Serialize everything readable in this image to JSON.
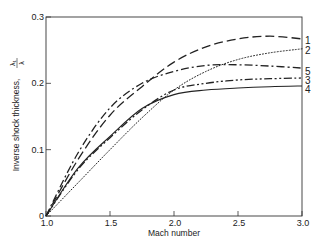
{
  "chart_data": {
    "type": "line",
    "title": "",
    "xlabel": "Mach number",
    "ylabel": "Inverse shock thickness, λ₁/λ",
    "xlim": [
      1.0,
      3.0
    ],
    "ylim": [
      0,
      0.3
    ],
    "x_ticks": [
      "1.0",
      "1.5",
      "2.0",
      "2.5",
      "3.0"
    ],
    "y_ticks": [
      "0",
      "0.1",
      "0.2",
      "0.3"
    ],
    "grid": false,
    "legend_position": "inline labels at right edge",
    "x": [
      1.0,
      1.25,
      1.5,
      1.75,
      2.0,
      2.25,
      2.5,
      2.75,
      3.0
    ],
    "series": [
      {
        "name": "1",
        "style": "long-dash",
        "values": [
          0,
          0.085,
          0.152,
          0.195,
          0.232,
          0.255,
          0.267,
          0.271,
          0.267
        ]
      },
      {
        "name": "2",
        "style": "dotted",
        "values": [
          0,
          0.05,
          0.1,
          0.148,
          0.19,
          0.218,
          0.236,
          0.246,
          0.252
        ]
      },
      {
        "name": "3",
        "style": "dash-dot-dot",
        "values": [
          0,
          0.07,
          0.118,
          0.16,
          0.19,
          0.2,
          0.205,
          0.207,
          0.208
        ]
      },
      {
        "name": "4",
        "style": "solid",
        "values": [
          0,
          0.072,
          0.12,
          0.162,
          0.183,
          0.19,
          0.193,
          0.195,
          0.196
        ]
      },
      {
        "name": "5",
        "style": "dash-dot",
        "values": [
          0,
          0.095,
          0.163,
          0.2,
          0.218,
          0.227,
          0.228,
          0.226,
          0.223
        ]
      }
    ]
  },
  "axes": {
    "xlabel": "Mach number",
    "ylabel_text": "Inverse shock thickness,",
    "ylabel_frac_num": "λ₁",
    "ylabel_frac_den": "λ"
  }
}
